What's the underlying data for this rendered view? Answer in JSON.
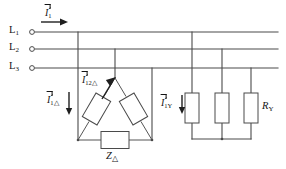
{
  "diagram": {
    "background_color": "#ffffff",
    "line_color": "#4a4a4a",
    "text_color": "#141414"
  },
  "bus_lines": [
    {
      "name": "L1",
      "base": "L",
      "index": "1",
      "y": 32
    },
    {
      "name": "L2",
      "base": "L",
      "index": "2",
      "y": 49
    },
    {
      "name": "L3",
      "base": "L",
      "index": "3",
      "y": 68
    }
  ],
  "supply_current": {
    "label_base": "I",
    "label_sub": "1",
    "label_full": "I1",
    "direction": "right"
  },
  "delta_load": {
    "phase_current": {
      "label_base": "I",
      "label_sub": "12△",
      "label_full": "I12△"
    },
    "line_current": {
      "label_base": "I",
      "label_sub": "1△",
      "label_full": "I1△",
      "direction": "down"
    },
    "impedance": {
      "label_base": "Z",
      "label_sub": "△",
      "label_full": "Z△"
    },
    "element_count": 3,
    "topology": "delta"
  },
  "wye_load": {
    "line_current": {
      "label_base": "I",
      "label_sub": "1Y",
      "label_full": "I1Y",
      "direction": "down"
    },
    "resistance": {
      "label_base": "R",
      "label_sub": "Y",
      "label_full": "RY"
    },
    "element_count": 3,
    "topology": "wye"
  }
}
